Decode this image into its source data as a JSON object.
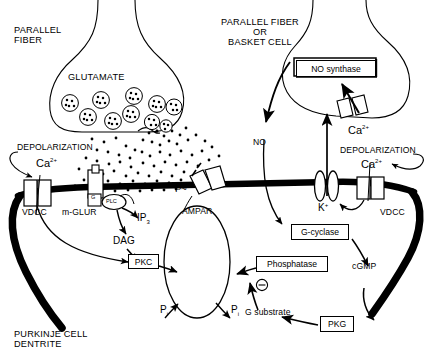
{
  "figure": {
    "type": "diagram"
  },
  "labels": {
    "parallel_fiber_l1": "PARALLEL",
    "parallel_fiber_l2": "FIBER",
    "glutamate": "GLUTAMATE",
    "parallel_or_basket_l1": "PARALLEL FIBER",
    "parallel_or_basket_l2": "OR",
    "parallel_or_basket_l3": "BASKET CELL",
    "depolarization_left": "DEPOLARIZATION",
    "depolarization_right": "DEPOLARIZATION",
    "ca_left": "Ca",
    "ca_left_sup": "2+",
    "ca_right": "Ca",
    "ca_right_sup": "2+",
    "ca_presyn": "Ca",
    "ca_presyn_sup": "2+",
    "vdcc_left": "VDCC",
    "vdcc_right": "VDCC",
    "mglur": "m-GLUR",
    "g_protein": "G",
    "plc": "PLC",
    "ip3": "IP",
    "ip3_sub": "3",
    "dag": "DAG",
    "pkc": "PKC",
    "ampar": "AMPAR",
    "p_tilde": "P~",
    "pi_left": "P",
    "pi_left_sub": "i",
    "pi_right": "P",
    "pi_right_sub": "i",
    "no": "NO",
    "no_synthase": "NO synthase",
    "k_plus": "K",
    "k_plus_sup": "+",
    "g_cyclase": "G-cyclase",
    "cgmp": "cGMP",
    "pkg": "PKG",
    "g_substrate": "G substrate",
    "phosphatase": "Phosphatase",
    "minus_sign": "⊖",
    "purkinje_l1": "PURKINJE CELL",
    "purkinje_l2": "DENTRITE"
  },
  "boxed_nodes": [
    {
      "name": "no-synthase",
      "text": "NO synthase"
    },
    {
      "name": "g-cyclase",
      "text": "G-cyclase"
    },
    {
      "name": "phosphatase",
      "text": "Phosphatase"
    },
    {
      "name": "pkg",
      "text": "PKG"
    },
    {
      "name": "pkc",
      "text": "PKC"
    }
  ],
  "pathways": [
    {
      "from": "Ca2+ (left VDCC)",
      "to": "PKC"
    },
    {
      "from": "m-GLUR / G / PLC",
      "to": "IP3"
    },
    {
      "from": "m-GLUR / G / PLC",
      "to": "DAG"
    },
    {
      "from": "DAG",
      "to": "PKC"
    },
    {
      "from": "PKC",
      "to": "AMPAR"
    },
    {
      "from": "AMPAR",
      "to": "Pi"
    },
    {
      "from": "Ca2+ (presynaptic)",
      "to": "NO synthase"
    },
    {
      "from": "NO synthase",
      "to": "NO"
    },
    {
      "from": "NO",
      "to": "G-cyclase"
    },
    {
      "from": "G-cyclase",
      "to": "cGMP"
    },
    {
      "from": "cGMP",
      "to": "PKG"
    },
    {
      "from": "PKG",
      "to": "G substrate"
    },
    {
      "from": "G substrate",
      "to": "Phosphatase (inhibits)"
    },
    {
      "from": "Phosphatase",
      "to": "AMPAR"
    },
    {
      "from": "Ca2+ (right VDCC)",
      "to": "K+ channel"
    }
  ],
  "colors": {
    "ink": "#000000",
    "paper": "#ffffff",
    "membrane": "#000000"
  },
  "vesicle_count": 10
}
